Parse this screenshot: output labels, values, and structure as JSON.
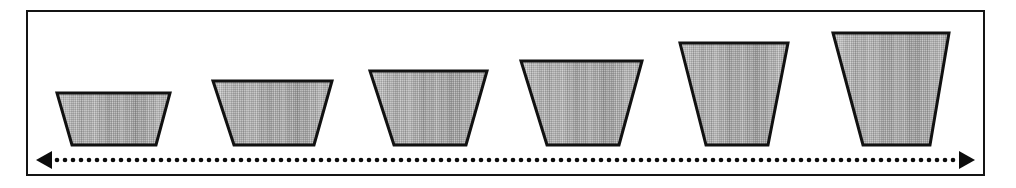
{
  "figure": {
    "title": "Progression of six inverted trapezoids increasing in size",
    "background_color": "#ffffff",
    "frame": {
      "border_color": "#141414",
      "border_width_px": 2,
      "x": 26,
      "y": 10,
      "width": 959,
      "height": 166
    }
  },
  "chart_data": {
    "type": "diagram",
    "title": "Progression of six inverted trapezoids increasing in size",
    "subtitle": "",
    "xlabel": "",
    "ylabel": "",
    "grid": false,
    "legend_position": "none",
    "baseline_y": 145,
    "shape_kind": "inverted-trapezoid",
    "categories": [
      "1",
      "2",
      "3",
      "4",
      "5",
      "6"
    ],
    "values": [
      52,
      64,
      74,
      84,
      102,
      112
    ],
    "value_meaning": "shape height in pixels, increasing left to right",
    "style": {
      "outline_color": "#111111",
      "outline_width_px": 3,
      "fill_light": "#c9c9c9",
      "fill_mid": "#a6a6a6",
      "fill_dark": "#8e8e8e",
      "fill_pattern": "vertical-dither-gradient"
    },
    "shapes": [
      {
        "index": 1,
        "label": "trapezoid-1",
        "top_y": 93,
        "bottom_y": 145,
        "top_left_x": 57,
        "top_right_x": 170,
        "bottom_left_x": 72,
        "bottom_right_x": 156,
        "height": 52,
        "top_width": 113,
        "bottom_width": 84
      },
      {
        "index": 2,
        "label": "trapezoid-2",
        "top_y": 81,
        "bottom_y": 145,
        "top_left_x": 213,
        "top_right_x": 332,
        "bottom_left_x": 234,
        "bottom_right_x": 314,
        "height": 64,
        "top_width": 119,
        "bottom_width": 80
      },
      {
        "index": 3,
        "label": "trapezoid-3",
        "top_y": 71,
        "bottom_y": 145,
        "top_left_x": 370,
        "top_right_x": 487,
        "bottom_left_x": 394,
        "bottom_right_x": 466,
        "height": 74,
        "top_width": 117,
        "bottom_width": 72
      },
      {
        "index": 4,
        "label": "trapezoid-4",
        "top_y": 61,
        "bottom_y": 145,
        "top_left_x": 521,
        "top_right_x": 642,
        "bottom_left_x": 547,
        "bottom_right_x": 619,
        "height": 84,
        "top_width": 121,
        "bottom_width": 72
      },
      {
        "index": 5,
        "label": "trapezoid-5",
        "top_y": 43,
        "bottom_y": 145,
        "top_left_x": 680,
        "top_right_x": 788,
        "bottom_left_x": 706,
        "bottom_right_x": 768,
        "height": 102,
        "top_width": 108,
        "bottom_width": 62
      },
      {
        "index": 6,
        "label": "trapezoid-6",
        "top_y": 33,
        "bottom_y": 145,
        "top_left_x": 833,
        "top_right_x": 949,
        "bottom_left_x": 863,
        "bottom_right_x": 930,
        "height": 112,
        "top_width": 116,
        "bottom_width": 67
      }
    ],
    "annotations": [
      {
        "name": "dotted-double-arrow",
        "type": "double-headed-dotted-arrow",
        "orientation": "horizontal",
        "y": 160,
        "x_start": 36,
        "x_end": 975,
        "color": "#0c0c0c",
        "dot_radius": 2.3,
        "dot_spacing": 8,
        "arrowhead_length": 16,
        "arrowhead_half_height": 9,
        "label": ""
      }
    ]
  }
}
